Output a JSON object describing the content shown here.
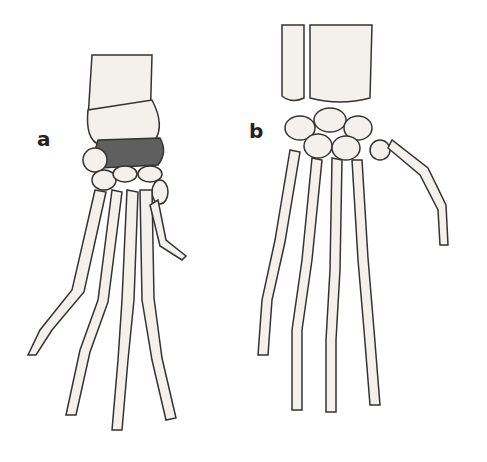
{
  "figure": {
    "panels": [
      {
        "label": "a",
        "description": "Skeletal forelimb with shaded carpal band and five long clawed digits"
      },
      {
        "label": "b",
        "description": "Skeletal hand with radius/ulna, carpals, and five digits with thumb splayed right"
      }
    ],
    "colors": {
      "bone": "#f4f1ec",
      "outline": "#333333",
      "highlight": "#5f5f5f",
      "background": "#ffffff"
    }
  }
}
